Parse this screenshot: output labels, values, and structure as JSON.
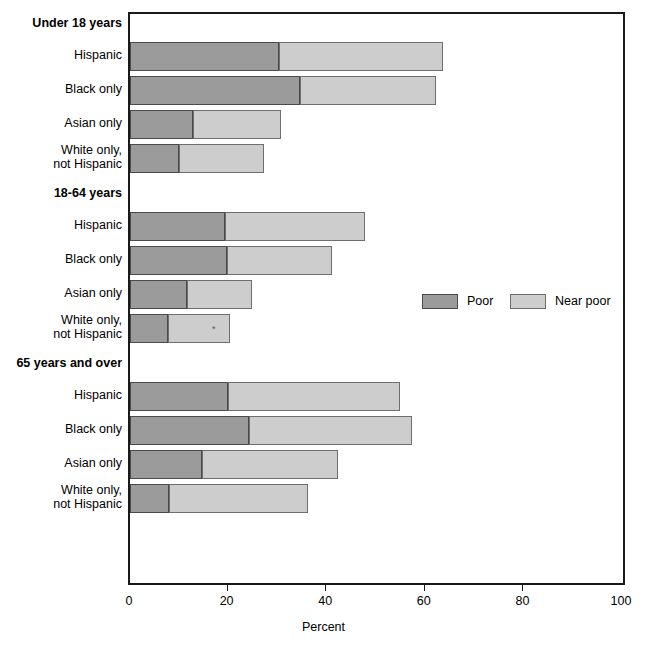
{
  "chart_data": {
    "type": "bar",
    "subtype": "stacked-horizontal-bar",
    "title": "",
    "xlabel": "Percent",
    "ylabel": "",
    "xlim": [
      0,
      100
    ],
    "xticks": [
      0,
      20,
      40,
      60,
      80,
      100
    ],
    "xtick_labels": [
      "0",
      "20",
      "40",
      "60",
      "80",
      "100"
    ],
    "grid": false,
    "legend_position": "middle-right",
    "orientation": "horizontal",
    "series": [
      {
        "name": "Poor",
        "color": "#9b9b9b"
      },
      {
        "name": "Near poor",
        "color": "#cdcdcd"
      }
    ],
    "groups": [
      {
        "label": "Under 18 years",
        "categories": [
          "Hispanic",
          "Black only",
          "Asian only",
          "White only,\nnot Hispanic"
        ],
        "poor": [
          30.2,
          34.4,
          12.7,
          9.9
        ],
        "near_poor": [
          33.2,
          27.6,
          17.9,
          17.3
        ],
        "total": [
          63.4,
          62.0,
          30.6,
          27.2
        ],
        "markers": [
          null,
          null,
          null,
          null
        ]
      },
      {
        "label": "18-64 years",
        "categories": [
          "Hispanic",
          "Black only",
          "Asian only",
          "White only,\nnot Hispanic"
        ],
        "poor": [
          19.3,
          19.7,
          11.5,
          7.8
        ],
        "near_poor": [
          28.4,
          21.3,
          13.2,
          12.5
        ],
        "total": [
          47.7,
          41.0,
          24.7,
          20.3
        ],
        "markers": [
          null,
          null,
          null,
          "*"
        ]
      },
      {
        "label": "65 years and over",
        "categories": [
          "Hispanic",
          "Black only",
          "Asian only",
          "White only,\nnot Hispanic"
        ],
        "poor": [
          19.9,
          24.1,
          14.7,
          8.0
        ],
        "near_poor": [
          34.8,
          33.2,
          27.5,
          28.2
        ],
        "total": [
          54.7,
          57.3,
          42.2,
          36.2
        ],
        "markers": [
          null,
          null,
          null,
          null
        ]
      }
    ]
  },
  "legend": {
    "items": [
      {
        "label": "Poor",
        "color": "#9b9b9b"
      },
      {
        "label": "Near poor",
        "color": "#cdcdcd"
      }
    ]
  },
  "axis": {
    "title": "Percent",
    "ticks": [
      "0",
      "20",
      "40",
      "60",
      "80",
      "100"
    ]
  },
  "groups": {
    "g0": {
      "header": "Under 18 years"
    },
    "g1": {
      "header": "18-64 years"
    },
    "g2": {
      "header": "65 years and over"
    }
  },
  "rows": {
    "hispanic": "Hispanic",
    "black": "Black only",
    "asian": "Asian only",
    "white": "White only,\nnot Hispanic"
  }
}
